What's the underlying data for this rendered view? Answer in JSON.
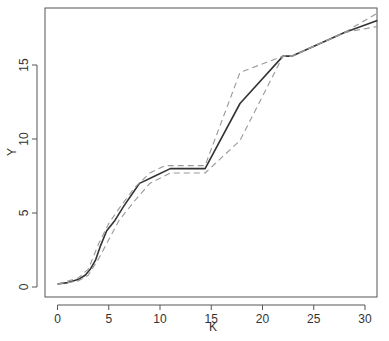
{
  "chart_data": {
    "type": "line",
    "title": "",
    "xlabel": "K",
    "ylabel": "Y",
    "xlim": [
      -1.2,
      31.2
    ],
    "ylim": [
      -0.7,
      18.9
    ],
    "x_ticks": [
      0,
      5,
      10,
      15,
      20,
      25,
      30
    ],
    "y_ticks": [
      0,
      5,
      10,
      15
    ],
    "grid": false,
    "legend": null,
    "series": [
      {
        "name": "estimate",
        "style": "solid",
        "color": "#333333",
        "points": [
          [
            0,
            0.2
          ],
          [
            1,
            0.3
          ],
          [
            2,
            0.5
          ],
          [
            2.7,
            0.8
          ],
          [
            3.2,
            1.2
          ],
          [
            3.7,
            1.8
          ],
          [
            4.2,
            2.8
          ],
          [
            4.8,
            3.8
          ],
          [
            5.6,
            4.5
          ],
          [
            6.5,
            5.5
          ],
          [
            7.3,
            6.3
          ],
          [
            8,
            7.0
          ],
          [
            9.5,
            7.5
          ],
          [
            11,
            8.0
          ],
          [
            14.4,
            8.0
          ],
          [
            17.8,
            12.4
          ],
          [
            22,
            15.6
          ],
          [
            22.9,
            15.6
          ],
          [
            28,
            17.2
          ],
          [
            31.2,
            18.0
          ]
        ]
      },
      {
        "name": "upper band",
        "style": "dashed",
        "color": "#999999",
        "points": [
          [
            0,
            0.2
          ],
          [
            2,
            0.6
          ],
          [
            3,
            1.2
          ],
          [
            4,
            2.9
          ],
          [
            5,
            4.3
          ],
          [
            6,
            5.3
          ],
          [
            7.5,
            6.7
          ],
          [
            9,
            7.7
          ],
          [
            10.5,
            8.2
          ],
          [
            14.4,
            8.2
          ],
          [
            17.8,
            14.5
          ],
          [
            22,
            15.6
          ],
          [
            22.9,
            15.6
          ],
          [
            28,
            17.2
          ],
          [
            31.2,
            18.5
          ]
        ]
      },
      {
        "name": "lower band",
        "style": "dashed",
        "color": "#999999",
        "points": [
          [
            0,
            0.2
          ],
          [
            2,
            0.4
          ],
          [
            3,
            0.8
          ],
          [
            4,
            1.9
          ],
          [
            5,
            3.2
          ],
          [
            6,
            4.5
          ],
          [
            7.5,
            5.8
          ],
          [
            9,
            7.0
          ],
          [
            11,
            7.7
          ],
          [
            14.4,
            7.7
          ],
          [
            17.8,
            9.9
          ],
          [
            22,
            15.6
          ],
          [
            22.9,
            15.6
          ],
          [
            28,
            17.2
          ],
          [
            31.2,
            17.6
          ]
        ]
      }
    ]
  },
  "axes": {
    "x_label": "K",
    "y_label": "Y",
    "x_tick_labels": [
      "0",
      "5",
      "10",
      "15",
      "20",
      "25",
      "30"
    ],
    "y_tick_labels": [
      "0",
      "5",
      "10",
      "15"
    ]
  }
}
